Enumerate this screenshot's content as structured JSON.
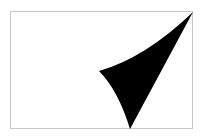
{
  "figure": {
    "frame": {
      "x": 10,
      "y": 11,
      "width": 183,
      "height": 118,
      "stroke": "#c8c8c8"
    },
    "shape": {
      "kind": "curved-triangle",
      "fill": "#000000",
      "vertices": {
        "top_right": [
          193,
          12
        ],
        "left": [
          99,
          71
        ],
        "bottom": [
          130,
          129
        ]
      }
    }
  }
}
